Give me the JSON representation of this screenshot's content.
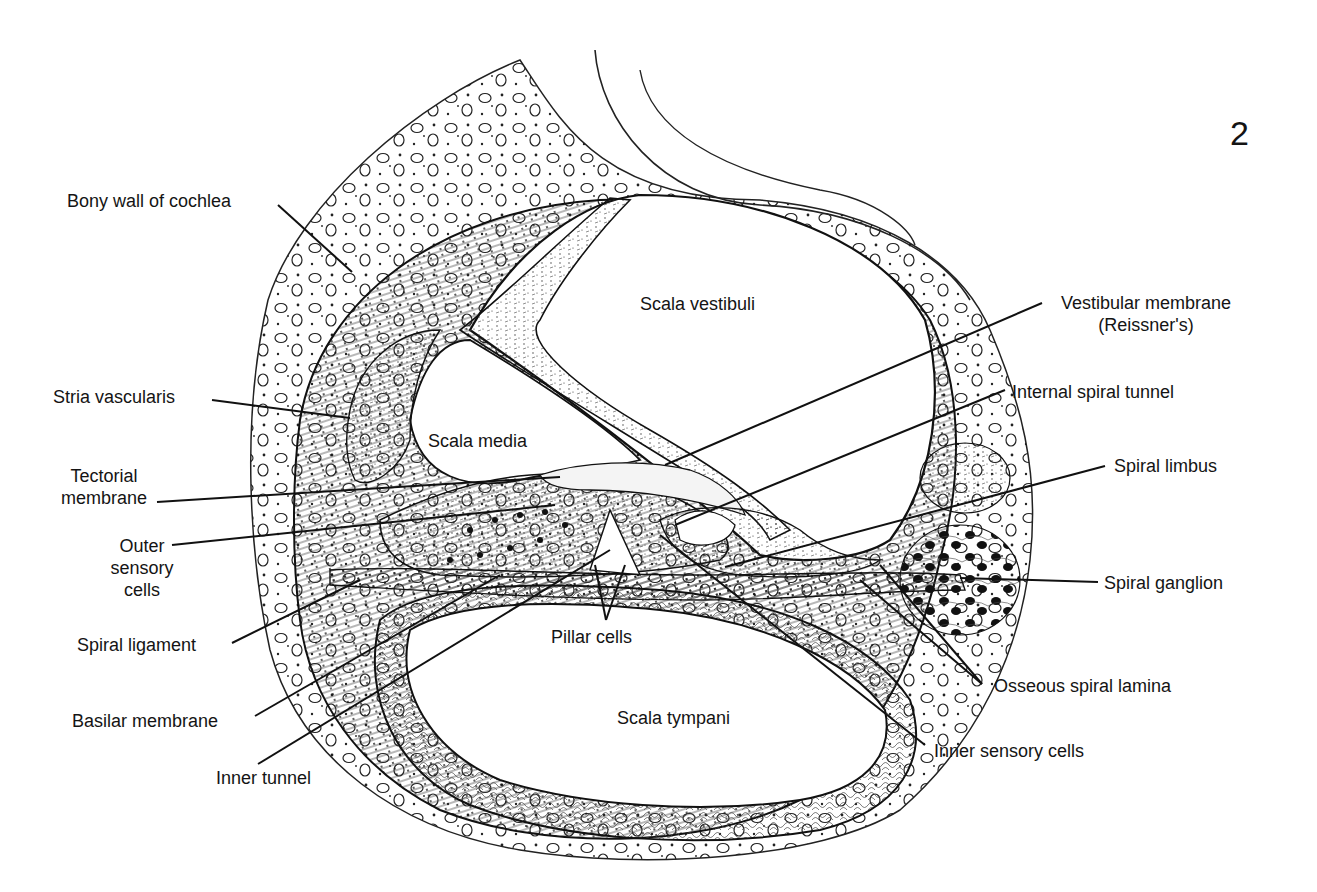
{
  "figure": {
    "number": "2"
  },
  "regions": {
    "scala_vestibuli": "Scala vestibuli",
    "scala_media": "Scala media",
    "scala_tympani": "Scala tympani"
  },
  "labels_left": [
    {
      "id": "bony-wall",
      "text": "Bony wall of cochlea"
    },
    {
      "id": "stria-vascularis",
      "text": "Stria vascularis"
    },
    {
      "id": "tectorial-membrane",
      "line1": "Tectorial",
      "line2": "membrane"
    },
    {
      "id": "outer-sensory-cells",
      "line1": "Outer",
      "line2": "sensory",
      "line3": "cells"
    },
    {
      "id": "spiral-ligament",
      "text": "Spiral ligament"
    },
    {
      "id": "basilar-membrane",
      "text": "Basilar membrane"
    },
    {
      "id": "inner-tunnel",
      "text": "Inner tunnel"
    }
  ],
  "labels_right": [
    {
      "id": "vestibular-membrane",
      "line1": "Vestibular membrane",
      "line2": "(Reissner's)"
    },
    {
      "id": "internal-spiral-tunnel",
      "text": "Internal spiral tunnel"
    },
    {
      "id": "spiral-limbus",
      "text": "Spiral limbus"
    },
    {
      "id": "spiral-ganglion",
      "text": "Spiral ganglion"
    },
    {
      "id": "osseous-spiral-lamina",
      "text": "Osseous spiral lamina"
    },
    {
      "id": "inner-sensory-cells",
      "text": "Inner sensory cells"
    }
  ],
  "labels_center": [
    {
      "id": "pillar-cells",
      "text": "Pillar cells"
    }
  ],
  "style": {
    "ink": "#141414",
    "paper": "#ffffff"
  }
}
